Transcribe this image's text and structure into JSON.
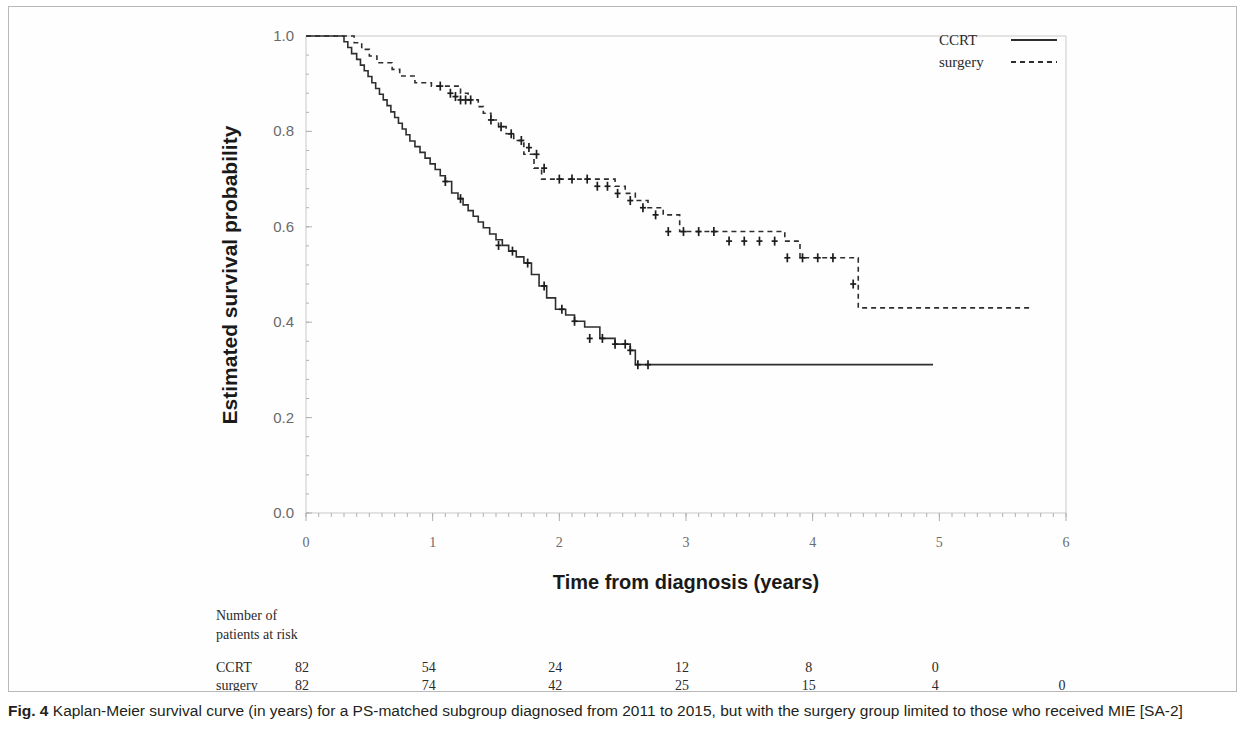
{
  "figure": {
    "caption_label": "Fig. 4",
    "caption_text": " Kaplan-Meier survival curve (in years) for a PS-matched subgroup diagnosed from 2011 to 2015, but with the surgery group limited to those who received MIE [SA-2]"
  },
  "risk_table": {
    "header_line1": "Number of",
    "header_line2": "patients at risk",
    "rows": [
      {
        "label": "CCRT",
        "values": [
          "82",
          "54",
          "24",
          "12",
          "8",
          "0",
          ""
        ]
      },
      {
        "label": "surgery",
        "values": [
          "82",
          "74",
          "42",
          "25",
          "15",
          "4",
          "0"
        ]
      }
    ]
  },
  "chart_data": {
    "type": "line",
    "title": "",
    "xlabel": "Time from diagnosis (years)",
    "ylabel": "Estimated survival probability",
    "xlim": [
      0,
      6
    ],
    "ylim": [
      0,
      1
    ],
    "xticks": [
      0,
      1,
      2,
      3,
      4,
      5,
      6
    ],
    "xticklabels": [
      "0",
      "1",
      "2",
      "3",
      "4",
      "5",
      "6"
    ],
    "yticks": [
      0.0,
      0.2,
      0.4,
      0.6,
      0.8,
      1.0
    ],
    "yticklabels": [
      "0.0",
      "0.2",
      "0.4",
      "0.6",
      "0.8",
      "1.0"
    ],
    "grid": false,
    "legend_position": "top-right",
    "legend": [
      {
        "name": "CCRT",
        "style": "solid"
      },
      {
        "name": "surgery",
        "style": "dashed"
      }
    ],
    "series": [
      {
        "name": "CCRT",
        "style": "solid",
        "steps_x": [
          0.0,
          0.26,
          0.3,
          0.33,
          0.36,
          0.4,
          0.43,
          0.46,
          0.49,
          0.52,
          0.55,
          0.58,
          0.61,
          0.64,
          0.67,
          0.7,
          0.73,
          0.76,
          0.79,
          0.82,
          0.86,
          0.9,
          0.94,
          0.98,
          1.02,
          1.06,
          1.1,
          1.15,
          1.2,
          1.24,
          1.28,
          1.32,
          1.36,
          1.4,
          1.45,
          1.5,
          1.55,
          1.6,
          1.66,
          1.72,
          1.78,
          1.84,
          1.9,
          1.97,
          2.05,
          2.12,
          2.2,
          2.32,
          2.44,
          2.56,
          2.6,
          4.95
        ],
        "steps_y": [
          1.0,
          1.0,
          0.988,
          0.976,
          0.963,
          0.951,
          0.939,
          0.927,
          0.915,
          0.902,
          0.89,
          0.878,
          0.866,
          0.854,
          0.841,
          0.829,
          0.817,
          0.805,
          0.793,
          0.78,
          0.768,
          0.756,
          0.744,
          0.732,
          0.72,
          0.707,
          0.695,
          0.671,
          0.659,
          0.646,
          0.634,
          0.622,
          0.61,
          0.598,
          0.585,
          0.573,
          0.561,
          0.549,
          0.537,
          0.524,
          0.5,
          0.476,
          0.451,
          0.427,
          0.415,
          0.402,
          0.39,
          0.366,
          0.354,
          0.341,
          0.311,
          0.311
        ],
        "censor_x": [
          1.1,
          1.22,
          1.52,
          1.63,
          1.75,
          1.88,
          2.02,
          2.12,
          2.24,
          2.34,
          2.44,
          2.52,
          2.56,
          2.62,
          2.7
        ],
        "censor_y": [
          0.695,
          0.659,
          0.561,
          0.549,
          0.524,
          0.476,
          0.427,
          0.402,
          0.366,
          0.366,
          0.354,
          0.354,
          0.341,
          0.311,
          0.311
        ],
        "final_x": 4.95,
        "final_y": 0.311
      },
      {
        "name": "surgery",
        "style": "dashed",
        "steps_x": [
          0.0,
          0.33,
          0.38,
          0.44,
          0.5,
          0.56,
          0.62,
          0.68,
          0.74,
          0.8,
          0.86,
          0.92,
          0.99,
          1.06,
          1.22,
          1.28,
          1.32,
          1.36,
          1.4,
          1.46,
          1.52,
          1.58,
          1.64,
          1.72,
          1.8,
          1.86,
          2.36,
          2.44,
          2.52,
          2.6,
          2.7,
          2.82,
          2.95,
          3.78,
          3.9,
          4.3,
          4.36,
          5.72
        ],
        "steps_y": [
          1.0,
          1.0,
          0.986,
          0.972,
          0.958,
          0.944,
          0.944,
          0.93,
          0.916,
          0.916,
          0.902,
          0.902,
          0.895,
          0.895,
          0.88,
          0.866,
          0.866,
          0.852,
          0.838,
          0.824,
          0.81,
          0.795,
          0.781,
          0.752,
          0.723,
          0.7,
          0.7,
          0.685,
          0.67,
          0.655,
          0.64,
          0.625,
          0.59,
          0.57,
          0.535,
          0.535,
          0.43,
          0.43
        ],
        "censor_x": [
          1.06,
          1.14,
          1.18,
          1.22,
          1.26,
          1.3,
          1.46,
          1.54,
          1.62,
          1.7,
          1.76,
          1.82,
          1.88,
          2.0,
          2.1,
          2.22,
          2.3,
          2.38,
          2.46,
          2.56,
          2.66,
          2.76,
          2.86,
          2.98,
          3.1,
          3.22,
          3.34,
          3.46,
          3.58,
          3.7,
          3.8,
          3.92,
          4.04,
          4.16,
          4.32
        ],
        "censor_y": [
          0.895,
          0.88,
          0.873,
          0.866,
          0.866,
          0.866,
          0.824,
          0.81,
          0.795,
          0.781,
          0.766,
          0.752,
          0.723,
          0.7,
          0.7,
          0.7,
          0.685,
          0.685,
          0.67,
          0.655,
          0.64,
          0.625,
          0.59,
          0.59,
          0.59,
          0.59,
          0.57,
          0.57,
          0.57,
          0.57,
          0.535,
          0.535,
          0.535,
          0.535,
          0.48
        ],
        "final_x": 5.72,
        "final_y": 0.43
      }
    ]
  }
}
